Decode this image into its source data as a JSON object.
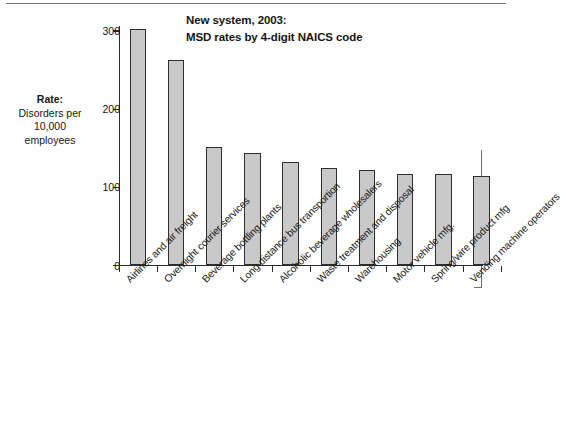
{
  "chart_data": {
    "type": "bar",
    "title": "New system, 2003: MSD rates by 4-digit NAICS code",
    "title_line1": "New system, 2003:",
    "title_line2": "MSD rates by 4-digit NAICS code",
    "ylabel": "Rate: Disorders per 10,000 employees",
    "ylabel_lines": [
      "Rate:",
      "Disorders per",
      "10,000",
      "employees"
    ],
    "xlabel": "",
    "ylim": [
      0,
      320
    ],
    "yticks": [
      0,
      100,
      200,
      300
    ],
    "ytick_labels": [
      "0",
      "100",
      "200",
      "300"
    ],
    "grid": false,
    "legend": false,
    "bar_color": "#c9c9c9",
    "bar_edge_color": "#2f2f2f",
    "axis_color": "#2b2b2b",
    "categories": [
      "Airlines and air freight",
      "Overnight courier services",
      "Beverage bottling plants",
      "Long distance bus transportion",
      "Alcoholic beverage wholesalers",
      "Waste treatment and disposal",
      "Warehousing",
      "Motor vehicle mfg.",
      "Spring/wire product mfg",
      "Vending machine operators"
    ],
    "values": [
      303,
      263,
      151,
      144,
      133,
      125,
      122,
      117,
      117,
      115
    ]
  }
}
